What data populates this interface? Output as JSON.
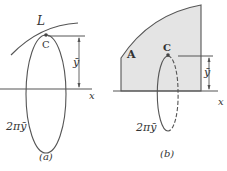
{
  "figure_a": {
    "curve_label": "L",
    "centroid_label": "C",
    "distance_label": "ȳ",
    "axis_label": "x",
    "circumference_label": "2πȳ",
    "caption": "(a)"
  },
  "figure_b": {
    "area_label": "A",
    "centroid_label": "C",
    "distance_label": "ȳ",
    "axis_label": "x",
    "circumference_label": "2πȳ",
    "caption": "(b)"
  },
  "colors": {
    "stroke": "#555555",
    "area_fill": "#e4e4e4",
    "text": "#333333"
  }
}
